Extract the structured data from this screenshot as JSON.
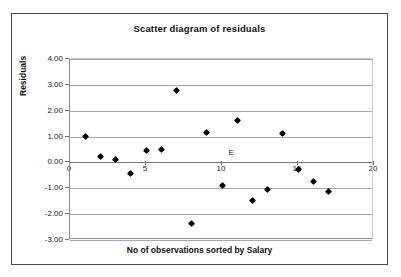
{
  "chart_data": {
    "type": "scatter",
    "title": "Scatter diagram of residuals",
    "xlabel": "No of observations sorted by Salary",
    "ylabel": "Residuals",
    "xlim": [
      0,
      20
    ],
    "ylim": [
      -3.0,
      4.0
    ],
    "xticks": [
      0,
      5,
      10,
      15,
      20
    ],
    "xtick_labels": [
      "0",
      "5",
      "10",
      "15",
      "20"
    ],
    "yticks": [
      4.0,
      3.0,
      2.0,
      1.0,
      0.0,
      -1.0,
      -2.0,
      -3.0
    ],
    "ytick_labels": [
      "4.00",
      "3.00",
      "2.00",
      "1.00",
      "0.00",
      "-1.00",
      "-2.00",
      "-3.00"
    ],
    "grid": true,
    "grid_axis": "y",
    "legend": "E",
    "legend_position": "inside-center",
    "marker": "diamond",
    "marker_color": "#000000",
    "series": [
      {
        "name": "E",
        "points": [
          {
            "x": 1,
            "y": 1.02
          },
          {
            "x": 2,
            "y": 0.23
          },
          {
            "x": 3,
            "y": 0.12
          },
          {
            "x": 4,
            "y": -0.43
          },
          {
            "x": 5,
            "y": 0.45
          },
          {
            "x": 6,
            "y": 0.51
          },
          {
            "x": 7,
            "y": 2.78
          },
          {
            "x": 8,
            "y": -2.37
          },
          {
            "x": 9,
            "y": 1.14
          },
          {
            "x": 10,
            "y": -0.89
          },
          {
            "x": 11,
            "y": 1.63
          },
          {
            "x": 12,
            "y": -1.49
          },
          {
            "x": 13,
            "y": -1.05
          },
          {
            "x": 14,
            "y": 1.13
          },
          {
            "x": 15,
            "y": -0.27
          },
          {
            "x": 16,
            "y": -0.72
          },
          {
            "x": 17,
            "y": -1.14
          }
        ]
      }
    ]
  }
}
